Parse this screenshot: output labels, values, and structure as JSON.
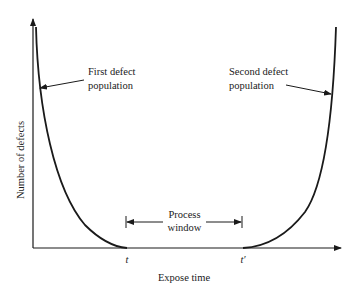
{
  "diagram": {
    "axes": {
      "x_label": "Expose time",
      "y_label": "Number of defects"
    },
    "annotations": {
      "first_population": [
        "First defect",
        "population"
      ],
      "second_population": [
        "Second defect",
        "population"
      ],
      "process_window": [
        "Process",
        "window"
      ]
    },
    "ticks": {
      "t": "t",
      "t_prime": "t′"
    },
    "colors": {
      "line": "#1a1a1a",
      "background": "#ffffff"
    }
  }
}
